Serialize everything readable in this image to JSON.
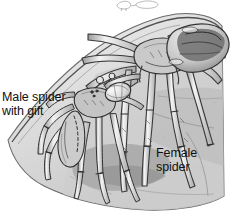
{
  "figure": {
    "kind": "scientific-illustration",
    "style": "grayscale pen-and-ink stipple drawing",
    "width": 232,
    "height": 217,
    "background_color": "#ffffff"
  },
  "labels": {
    "male": {
      "line1": "Male spider",
      "line2": "with gift"
    },
    "female": {
      "line1": "Female",
      "line2": "spider"
    }
  },
  "palette": {
    "paper": "#ffffff",
    "ink": "#2b2b2b",
    "ink_light": "#6e6e6e",
    "leaf_light": "#e2e2e2",
    "leaf_mid": "#cfcfcf",
    "leaf_shadow": "#b0b0b0",
    "body_fill": "#d8d8d8",
    "body_dark": "#4a4a4a",
    "text": "#111111"
  },
  "elements": {
    "top_sketch_fragment": "faint partial sketch remnant at top edge",
    "leaf_edge": "curved leaf margin running from lower-left to upper-right",
    "female_spider": "large spider occupying right and upper portion, legs splayed downward",
    "male_spider": "smaller spider at left-center, holding wrapped gift"
  }
}
